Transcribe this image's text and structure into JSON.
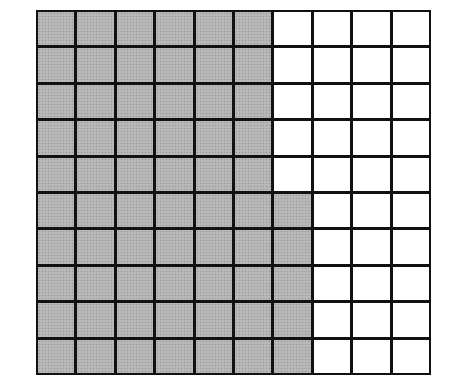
{
  "diagram": {
    "type": "hundred-grid",
    "rows": 10,
    "columns": 10,
    "shaded_per_row": [
      6,
      6,
      6,
      6,
      6,
      7,
      7,
      7,
      7,
      7
    ],
    "total_cells": 100,
    "shaded_cells": 65,
    "unshaded_cells": 35,
    "colors": {
      "shaded_fill": "#b4b4b4",
      "unshaded_fill": "#ffffff",
      "grid_line": "#111111"
    }
  }
}
